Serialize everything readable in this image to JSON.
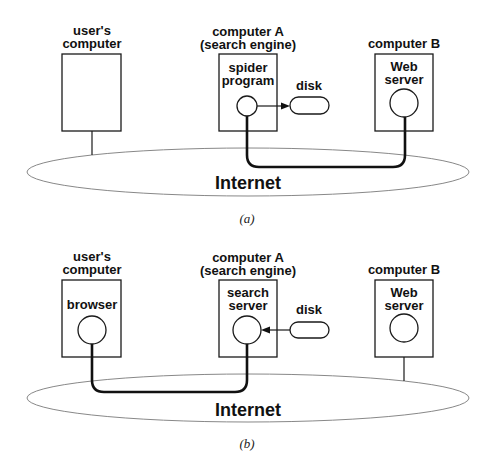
{
  "figure": {
    "panels": [
      {
        "caption": "(a)",
        "network_label": "Internet",
        "users_computer": {
          "label_line1": "user's",
          "label_line2": "computer",
          "process": null
        },
        "computer_a": {
          "label_line1": "computer A",
          "label_line2": "(search engine)",
          "process_line1": "spider",
          "process_line2": "program"
        },
        "disk": {
          "label": "disk",
          "arrow_direction": "process-to-disk"
        },
        "computer_b": {
          "label_line1": "computer B",
          "process_line1": "Web",
          "process_line2": "server"
        },
        "connection": "spider program <-> Web server"
      },
      {
        "caption": "(b)",
        "network_label": "Internet",
        "users_computer": {
          "label_line1": "user's",
          "label_line2": "computer",
          "process_line1": "browser"
        },
        "computer_a": {
          "label_line1": "computer A",
          "label_line2": "(search engine)",
          "process_line1": "search",
          "process_line2": "server"
        },
        "disk": {
          "label": "disk",
          "arrow_direction": "disk-to-process"
        },
        "computer_b": {
          "label_line1": "computer B",
          "process_line1": "Web",
          "process_line2": "server"
        },
        "connection": "browser <-> search server"
      }
    ],
    "colors": {
      "ink": "#111111",
      "network_outline": "#888888",
      "background": "#ffffff"
    }
  }
}
